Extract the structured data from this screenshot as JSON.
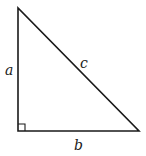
{
  "diagram": {
    "type": "right-triangle",
    "stroke_color": "#1a1a1a",
    "background_color": "#ffffff",
    "vertices": {
      "top": [
        18,
        8
      ],
      "right_angle": [
        18,
        131
      ],
      "bottom_right": [
        139,
        131
      ]
    },
    "right_angle_marker_size": 7,
    "labels": {
      "leg_vertical": "a",
      "hypotenuse": "c",
      "leg_horizontal": "b"
    }
  }
}
